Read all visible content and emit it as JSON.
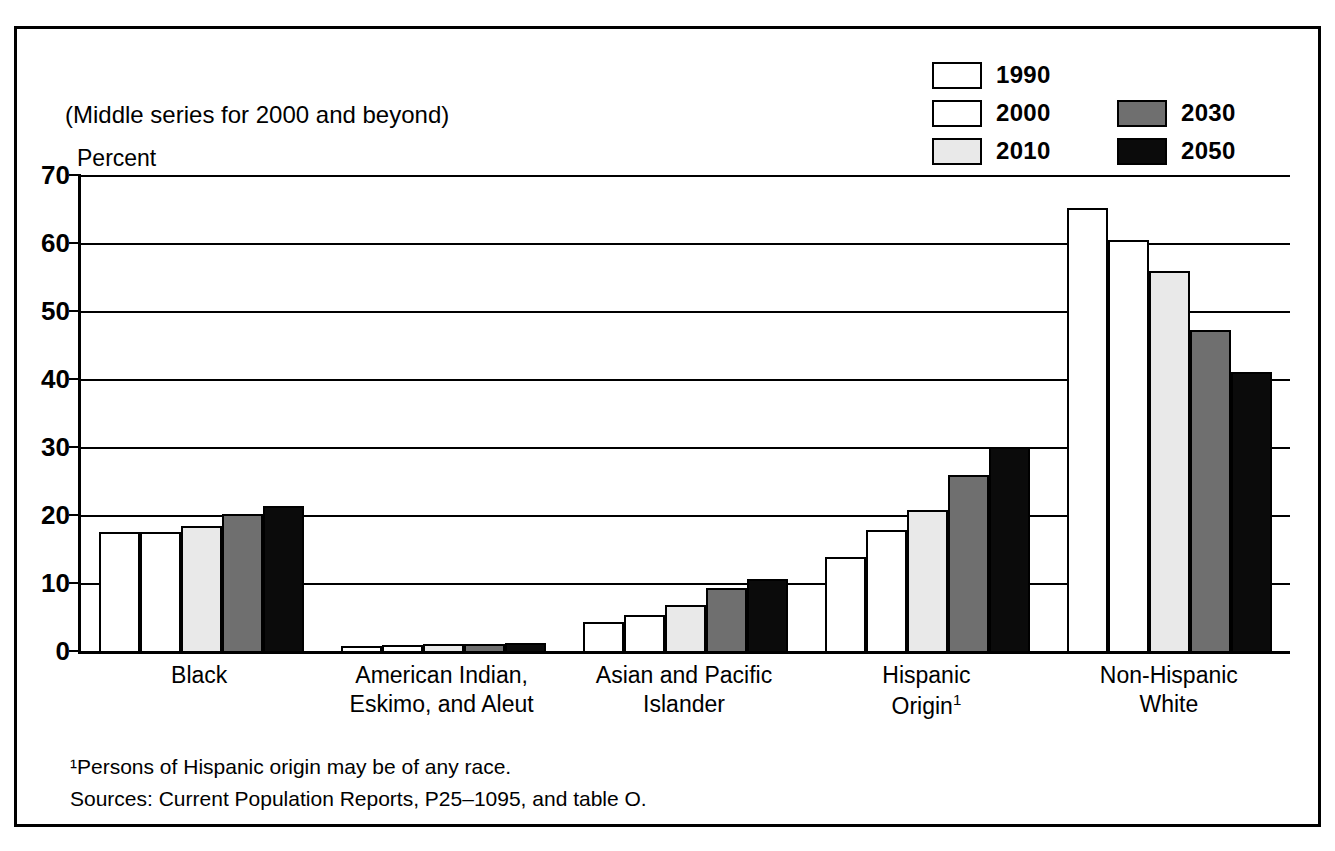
{
  "top_clipped_text": "",
  "figure": {
    "subtitle": "(Middle series for 2000 and beyond)",
    "y_axis_title": "Percent"
  },
  "legend": {
    "column_left": [
      {
        "label": "1990",
        "swatch": "white-swatch",
        "color": "#ffffff"
      },
      {
        "label": "2000",
        "swatch": "white-swatch",
        "color": "#ffffff"
      },
      {
        "label": "2010",
        "swatch": "light-gray-swatch",
        "color": "#e9e9e9"
      }
    ],
    "column_right": [
      {
        "label": "2030",
        "swatch": "medium-gray-swatch",
        "color": "#6f6f6f"
      },
      {
        "label": "2050",
        "swatch": "black-swatch",
        "color": "#0b0b0b"
      }
    ]
  },
  "y_ticks": [
    "70",
    "60",
    "50",
    "40",
    "30",
    "20",
    "10",
    "0"
  ],
  "x_labels": [
    "Black",
    "American Indian,\nEskimo, and Aleut",
    "Asian and Pacific\nIslander",
    "Hispanic\nOrigin",
    "Non-Hispanic\nWhite"
  ],
  "x_label_superscripts": [
    "",
    "",
    "",
    "1",
    ""
  ],
  "footnotes": [
    "¹Persons of Hispanic origin may be of any race.",
    "Sources: Current Population Reports, P25–1095, and table O."
  ],
  "chart_data": {
    "type": "bar",
    "title": "",
    "subtitle": "(Middle series for 2000 and beyond)",
    "xlabel": "",
    "ylabel": "Percent",
    "ylim": [
      0,
      70
    ],
    "ytick_step": 10,
    "grid": true,
    "legend_position": "top-right",
    "categories": [
      "Black",
      "American Indian, Eskimo, and Aleut",
      "Asian and Pacific Islander",
      "Hispanic Origin",
      "Non-Hispanic White"
    ],
    "series": [
      {
        "name": "1990",
        "color": "#ffffff",
        "values": [
          17.5,
          0.8,
          4.2,
          13.8,
          65.1
        ]
      },
      {
        "name": "2000",
        "color": "#ffffff",
        "values": [
          17.5,
          0.9,
          5.3,
          17.8,
          60.5
        ]
      },
      {
        "name": "2010",
        "color": "#e9e9e9",
        "values": [
          18.4,
          1.0,
          6.7,
          20.7,
          55.9
        ]
      },
      {
        "name": "2030",
        "color": "#6f6f6f",
        "values": [
          20.1,
          1.1,
          9.2,
          25.9,
          47.2
        ]
      },
      {
        "name": "2050",
        "color": "#0b0b0b",
        "values": [
          21.3,
          1.2,
          10.6,
          30.0,
          41.0
        ]
      }
    ]
  }
}
